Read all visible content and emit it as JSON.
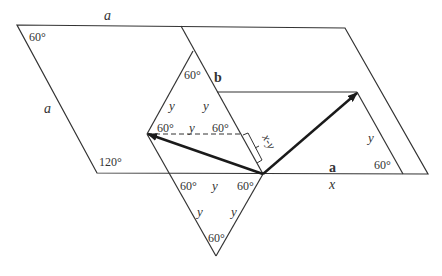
{
  "diagram": {
    "type": "geometry-vector-decomposition",
    "side_labels": {
      "top": "a",
      "left": "a",
      "vector_a": "a",
      "vector_b": "b",
      "x": "x",
      "x_minus_y": "x-y"
    },
    "angles": {
      "top_left": "60°",
      "bottom_left": "120°",
      "upper_triangle_apex": "60°",
      "upper_triangle_left": "60°",
      "upper_triangle_right": "60°",
      "lower_triangle_left": "60°",
      "lower_triangle_right": "60°",
      "lower_triangle_bottom": "60°",
      "right_parallelogram": "60°"
    },
    "y_labels": {
      "upper_left_side": "y",
      "upper_right_side": "y",
      "upper_base": "y",
      "lower_top": "y",
      "lower_left_side": "y",
      "lower_right_side": "y",
      "right_side": "y"
    },
    "colors": {
      "line": "#333333",
      "arrow": "#1a1a1a",
      "background": "#ffffff"
    }
  }
}
